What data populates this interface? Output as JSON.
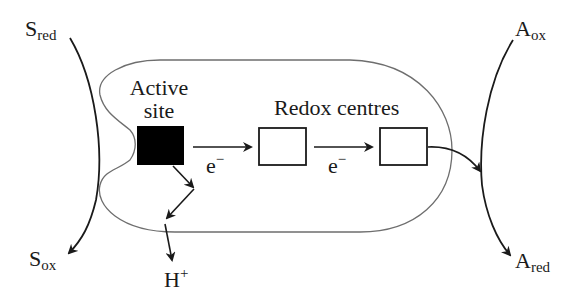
{
  "diagram": {
    "substrate": {
      "reduced": {
        "main": "S",
        "sub": "red"
      },
      "oxidized": {
        "main": "S",
        "sub": "ox"
      }
    },
    "acceptor": {
      "oxidized": {
        "main": "A",
        "sub": "ox"
      },
      "reduced": {
        "main": "A",
        "sub": "red"
      }
    },
    "active_site": {
      "line1": "Active",
      "line2": "site"
    },
    "redox_centres_label": "Redox centres",
    "electron_labels": [
      {
        "main": "e",
        "sup": "−"
      },
      {
        "main": "e",
        "sup": "−"
      }
    ],
    "proton": {
      "main": "H",
      "sup": "+"
    },
    "colors": {
      "line": "#1a1a1a",
      "outline": "#6e6e6e",
      "active_site_fill": "#000000",
      "background": "#ffffff"
    }
  }
}
